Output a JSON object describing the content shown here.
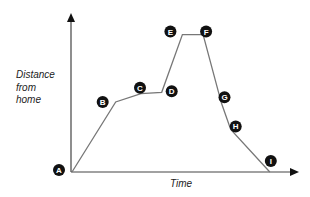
{
  "chart_data": {
    "type": "line",
    "title": "",
    "xlabel": "Time",
    "ylabel": "Distance from home",
    "ylabel_lines": [
      "Distance",
      "from",
      "home"
    ],
    "grid": false,
    "legend": null,
    "points": [
      {
        "label": "A",
        "x": 0,
        "y": 0
      },
      {
        "label": "B",
        "x": 19,
        "y": 51
      },
      {
        "label": "C",
        "x": 30,
        "y": 57
      },
      {
        "label": "D",
        "x": 39,
        "y": 58
      },
      {
        "label": "E",
        "x": 48,
        "y": 100
      },
      {
        "label": "F",
        "x": 57,
        "y": 100
      },
      {
        "label": "G",
        "x": 65,
        "y": 50
      },
      {
        "label": "H",
        "x": 69,
        "y": 31
      },
      {
        "label": "I",
        "x": 86,
        "y": 0
      }
    ],
    "xlim": [
      0,
      100
    ],
    "ylim": [
      0,
      115
    ],
    "line_color": "#777777",
    "marker_color": "#111111",
    "axis_color": "#444444"
  }
}
